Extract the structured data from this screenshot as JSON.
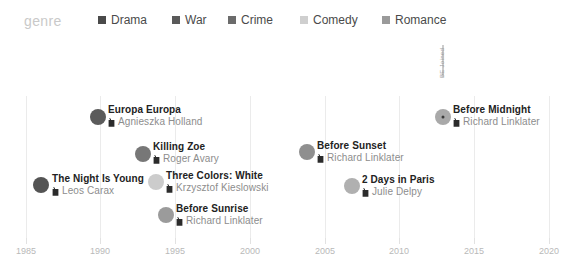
{
  "legend": {
    "title": "genre",
    "items": [
      {
        "label": "Drama",
        "color": "#4a4a4a",
        "x": 98
      },
      {
        "label": "War",
        "color": "#5a5a5a",
        "x": 172
      },
      {
        "label": "Crime",
        "color": "#6b6b6b",
        "x": 228
      },
      {
        "label": "Comedy",
        "color": "#cfcfcf",
        "x": 300
      },
      {
        "label": "Romance",
        "color": "#9a9a9a",
        "x": 382
      }
    ]
  },
  "axis": {
    "ticks": [
      {
        "label": "1985",
        "x": 26
      },
      {
        "label": "1990",
        "x": 100
      },
      {
        "label": "1995",
        "x": 175
      },
      {
        "label": "2000",
        "x": 250
      },
      {
        "label": "2005",
        "x": 325
      },
      {
        "label": "2010",
        "x": 399
      },
      {
        "label": "2015",
        "x": 474
      },
      {
        "label": "2020",
        "x": 549
      }
    ],
    "gridlines": [
      26,
      100,
      175,
      250,
      325,
      399,
      474,
      549
    ]
  },
  "annotation": {
    "text": "BE Joined"
  },
  "chart_data": {
    "type": "scatter",
    "title": "",
    "xlabel": "",
    "ylabel": "",
    "xlim": [
      1985,
      2020
    ],
    "grid": true,
    "legend_position": "top",
    "icons": {
      "director": "director-icon"
    },
    "points": [
      {
        "title": "The Night Is Young",
        "director": "Leos Carax",
        "genre": "Drama",
        "year": 1986,
        "color": "#545454",
        "px": 41,
        "py": 145,
        "label_x": 52,
        "label_y": 145,
        "highlighted": false
      },
      {
        "title": "Europa Europa",
        "director": "Agnieszka Holland",
        "genre": "War",
        "year": 1990,
        "color": "#5b5b5b",
        "px": 98,
        "py": 77,
        "label_x": 108,
        "label_y": 76,
        "highlighted": false
      },
      {
        "title": "Killing Zoe",
        "director": "Roger Avary",
        "genre": "Crime",
        "year": 1993,
        "color": "#777777",
        "px": 143,
        "py": 114,
        "label_x": 153,
        "label_y": 113,
        "highlighted": false
      },
      {
        "title": "Three Colors: White",
        "director": "Krzysztof Kieslowski",
        "genre": "Comedy",
        "year": 1994,
        "color": "#cccccc",
        "px": 156,
        "py": 142,
        "label_x": 166,
        "label_y": 142,
        "highlighted": false
      },
      {
        "title": "Before Sunrise",
        "director": "Richard Linklater",
        "genre": "Romance",
        "year": 1995,
        "color": "#9b9b9b",
        "px": 166,
        "py": 175,
        "label_x": 176,
        "label_y": 175,
        "highlighted": false
      },
      {
        "title": "Before Sunset",
        "director": "Richard Linklater",
        "genre": "Romance",
        "year": 2004,
        "color": "#8f8f8f",
        "px": 307,
        "py": 112,
        "label_x": 317,
        "label_y": 112,
        "highlighted": false
      },
      {
        "title": "2 Days in Paris",
        "director": "Julie Delpy",
        "genre": "Comedy",
        "year": 2007,
        "color": "#b0b0b0",
        "px": 352,
        "py": 146,
        "label_x": 362,
        "label_y": 146,
        "highlighted": false
      },
      {
        "title": "Before Midnight",
        "director": "Richard Linklater",
        "genre": "Romance",
        "year": 2013,
        "color": "#a9a9a9",
        "px": 443,
        "py": 77,
        "label_x": 453,
        "label_y": 76,
        "highlighted": true,
        "stem": {
          "top": 5,
          "height": 32
        }
      }
    ]
  }
}
